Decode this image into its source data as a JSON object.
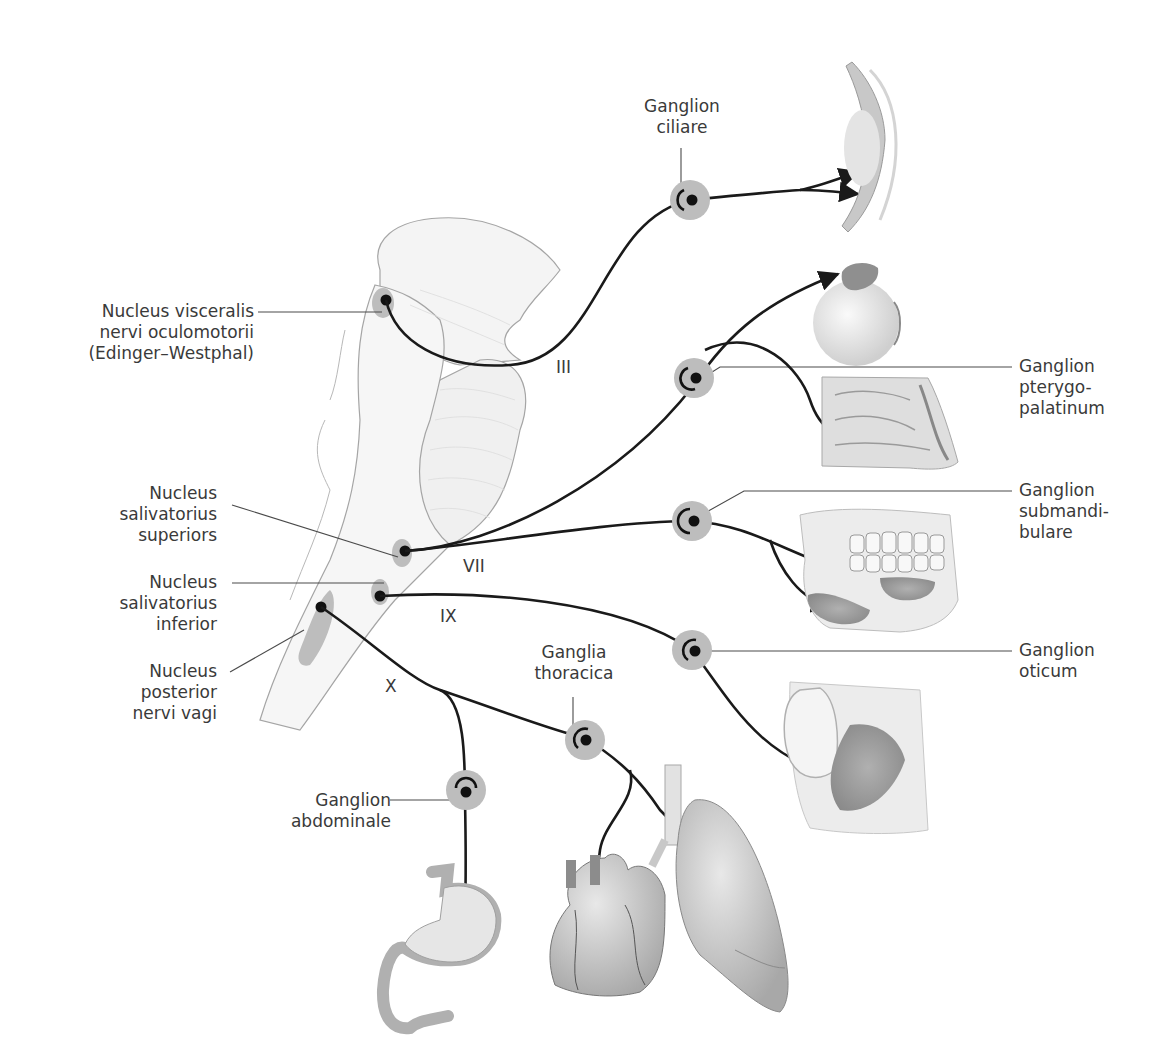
{
  "diagram": {
    "type": "anatomical-schematic",
    "colors": {
      "background": "#ffffff",
      "nerve_line": "#1a1a1a",
      "leader_line": "#4a4a4a",
      "ganglion_halo": "#bdbdbd",
      "nucleus_halo": "#9e9e9e",
      "brainstem_fill": "#f3f3f3",
      "brainstem_outline": "#9a9a9a",
      "organ_fill": "#d8d8d8",
      "label_text": "#3a3a3a"
    },
    "nuclei": [
      {
        "id": "edinger-westphal",
        "lines": [
          "Nucleus visceralis",
          "nervi oculomotorii",
          "(Edinger–Westphal)"
        ]
      },
      {
        "id": "salivatorius-superior",
        "lines": [
          "Nucleus",
          "salivatorius",
          "superiors"
        ]
      },
      {
        "id": "salivatorius-inferior",
        "lines": [
          "Nucleus",
          "salivatorius",
          "inferior"
        ]
      },
      {
        "id": "posterior-vagi",
        "lines": [
          "Nucleus",
          "posterior",
          "nervi vagi"
        ]
      }
    ],
    "ganglia": [
      {
        "id": "ciliare",
        "lines": [
          "Ganglion",
          "ciliare"
        ]
      },
      {
        "id": "pterygopalatinum",
        "lines": [
          "Ganglion",
          "pterygo-",
          "palatinum"
        ]
      },
      {
        "id": "submandibulare",
        "lines": [
          "Ganglion",
          "submandi-",
          "bulare"
        ]
      },
      {
        "id": "oticum",
        "lines": [
          "Ganglion",
          "oticum"
        ]
      },
      {
        "id": "thoracica",
        "lines": [
          "Ganglia",
          "thoracica"
        ]
      },
      {
        "id": "abdominale",
        "lines": [
          "Ganglion",
          "abdominale"
        ]
      }
    ],
    "nerves": [
      {
        "id": "III",
        "label": "III"
      },
      {
        "id": "VII",
        "label": "VII"
      },
      {
        "id": "IX",
        "label": "IX"
      },
      {
        "id": "X",
        "label": "X"
      }
    ],
    "targets": [
      "eye-lens-ciliary-body",
      "eyeball-lacrimal-gland",
      "nasal-cavity",
      "mandible-submandibular-sublingual-glands",
      "ear-parotid-gland",
      "stomach",
      "heart",
      "lung"
    ]
  }
}
